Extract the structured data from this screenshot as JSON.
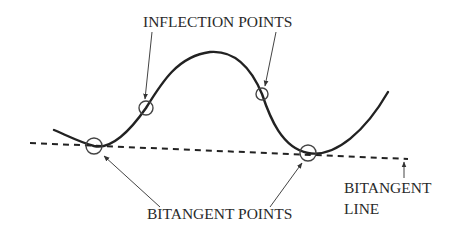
{
  "labels": {
    "inflection_points": "INFLECTION POINTS",
    "bitangent_points": "BITANGENT POINTS",
    "bitangent_line_1": "BITANGENT",
    "bitangent_line_2": "LINE"
  },
  "colors": {
    "stroke": "#222222",
    "thin_stroke": "#444444",
    "text": "#2a2a2a",
    "background": "#ffffff"
  },
  "geometry": {
    "curve_path": "M54,130 C68,136 82,143 94,146 C112,150 132,128 146,108 C162,82 178,56 210,52 C236,50 252,70 262,94 C270,118 282,148 308,153 C336,158 366,130 388,92",
    "bitangent_line": {
      "x1": 30,
      "y1": 143,
      "x2": 408,
      "y2": 159
    },
    "inflection_circles": [
      {
        "cx": 146,
        "cy": 108,
        "r": 7
      },
      {
        "cx": 262,
        "cy": 94,
        "r": 6
      }
    ],
    "bitangent_circles": [
      {
        "cx": 94,
        "cy": 146,
        "r": 8
      },
      {
        "cx": 308,
        "cy": 153,
        "r": 8
      }
    ],
    "arrows": [
      {
        "name": "inflection-arrow-left",
        "x1": 152,
        "y1": 32,
        "x2": 145,
        "y2": 99
      },
      {
        "name": "inflection-arrow-right",
        "x1": 276,
        "y1": 32,
        "x2": 265,
        "y2": 86
      },
      {
        "name": "bitangent-arrow-left",
        "x1": 160,
        "y1": 207,
        "x2": 104,
        "y2": 156
      },
      {
        "name": "bitangent-arrow-right",
        "x1": 270,
        "y1": 207,
        "x2": 302,
        "y2": 163
      },
      {
        "name": "bitangent-line-arrow",
        "x1": 404,
        "y1": 178,
        "x2": 404,
        "y2": 162
      }
    ]
  }
}
